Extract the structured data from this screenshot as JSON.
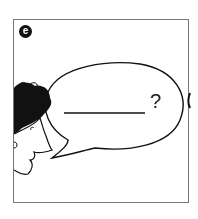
{
  "panel": {
    "badge_label": "e",
    "speech_bubble": {
      "blank_line": "______",
      "question_mark": "?"
    }
  },
  "colors": {
    "ink": "#111111",
    "frame": "#777777",
    "background": "#ffffff"
  }
}
